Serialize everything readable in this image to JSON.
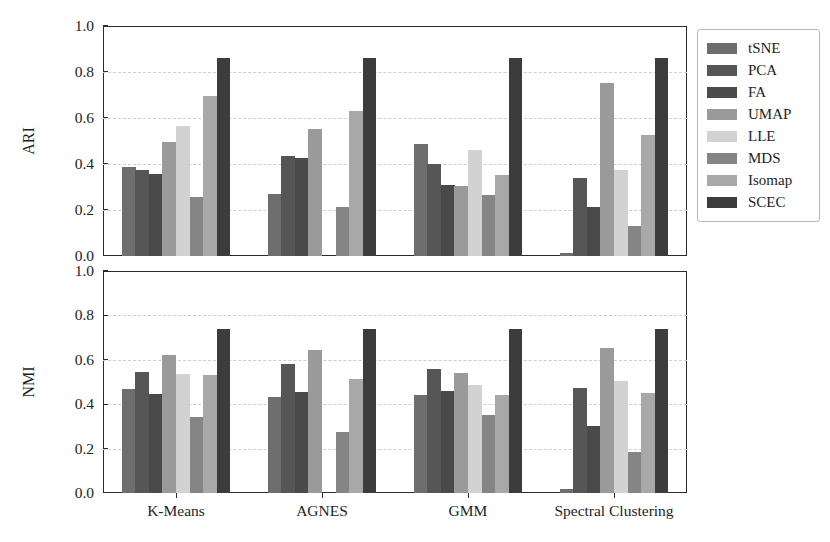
{
  "chart_data": {
    "type": "bar",
    "title": "",
    "grid": true,
    "legend_position": "right-outside",
    "xlabel": "",
    "categories": [
      "K-Means",
      "AGNES",
      "GMM",
      "Spectral Clustering"
    ],
    "series_names": [
      "tSNE",
      "PCA",
      "FA",
      "UMAP",
      "LLE",
      "MDS",
      "Isomap",
      "SCEC"
    ],
    "series_colors": [
      "#6e6e6e",
      "#565656",
      "#4a4a4a",
      "#9a9a9a",
      "#d2d2d2",
      "#858585",
      "#a8a8a8",
      "#3c3c3c"
    ],
    "panels": [
      {
        "ylabel": "ARI",
        "ylim": [
          0.0,
          1.0
        ],
        "yticks": [
          "0.0",
          "0.2",
          "0.4",
          "0.6",
          "0.8",
          "1.0"
        ],
        "ytick_values": [
          0.0,
          0.2,
          0.4,
          0.6,
          0.8,
          1.0
        ],
        "series": [
          {
            "name": "tSNE",
            "values": [
              0.385,
              0.27,
              0.485,
              0.015
            ]
          },
          {
            "name": "PCA",
            "values": [
              0.372,
              0.437,
              0.398,
              0.34
            ]
          },
          {
            "name": "FA",
            "values": [
              0.355,
              0.425,
              0.31,
              0.215
            ]
          },
          {
            "name": "UMAP",
            "values": [
              0.497,
              0.553,
              0.305,
              0.753
            ]
          },
          {
            "name": "LLE",
            "values": [
              0.567,
              0.0,
              0.463,
              0.375
            ]
          },
          {
            "name": "MDS",
            "values": [
              0.255,
              0.213,
              0.265,
              0.13
            ]
          },
          {
            "name": "Isomap",
            "values": [
              0.697,
              0.63,
              0.352,
              0.527
            ]
          },
          {
            "name": "SCEC",
            "values": [
              0.86,
              0.86,
              0.86,
              0.86
            ]
          }
        ]
      },
      {
        "ylabel": "NMI",
        "ylim": [
          0.0,
          1.0
        ],
        "yticks": [
          "0.0",
          "0.2",
          "0.4",
          "0.6",
          "0.8",
          "1.0"
        ],
        "ytick_values": [
          0.0,
          0.2,
          0.4,
          0.6,
          0.8,
          1.0
        ],
        "series": [
          {
            "name": "tSNE",
            "values": [
              0.47,
              0.432,
              0.44,
              0.018
            ]
          },
          {
            "name": "PCA",
            "values": [
              0.547,
              0.583,
              0.558,
              0.473
            ]
          },
          {
            "name": "FA",
            "values": [
              0.447,
              0.455,
              0.46,
              0.303
            ]
          },
          {
            "name": "UMAP",
            "values": [
              0.622,
              0.645,
              0.542,
              0.655
            ]
          },
          {
            "name": "LLE",
            "values": [
              0.535,
              0.0,
              0.487,
              0.503
            ]
          },
          {
            "name": "MDS",
            "values": [
              0.342,
              0.275,
              0.353,
              0.187
            ]
          },
          {
            "name": "Isomap",
            "values": [
              0.533,
              0.512,
              0.443,
              0.45
            ]
          },
          {
            "name": "SCEC",
            "values": [
              0.74,
              0.74,
              0.74,
              0.74
            ]
          }
        ]
      }
    ]
  }
}
